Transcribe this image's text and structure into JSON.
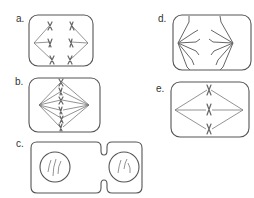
{
  "diagram": {
    "panels": [
      {
        "id": "a",
        "label": "a.",
        "stage": "anaphase (early)"
      },
      {
        "id": "b",
        "label": "b.",
        "stage": "metaphase"
      },
      {
        "id": "c",
        "label": "c.",
        "stage": "telophase / cytokinesis"
      },
      {
        "id": "d",
        "label": "d.",
        "stage": "anaphase (late)"
      },
      {
        "id": "e",
        "label": "e.",
        "stage": "metaphase (simplified)"
      }
    ]
  }
}
